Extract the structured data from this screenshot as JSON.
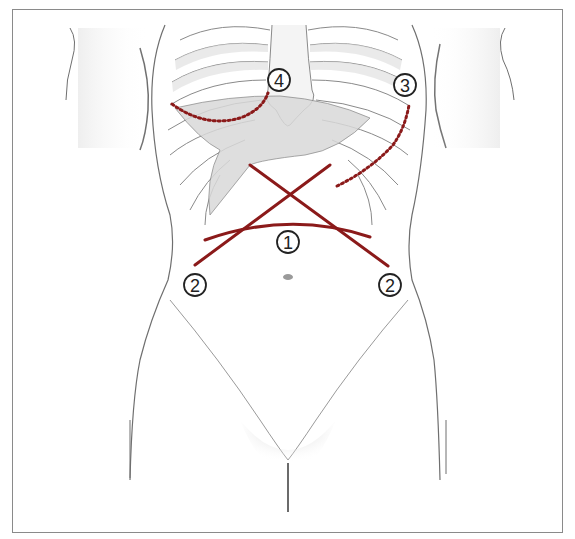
{
  "figure": {
    "type": "anatomical-illustration",
    "frame_color": "#8a8a8a",
    "incision_color": "#8b1a1a",
    "dotted_incision_color": "#8b1a1a",
    "outline_color": "#6f6f6f",
    "shade_color": "#d6d6d6"
  },
  "labels": [
    {
      "id": "1",
      "text": "1",
      "description": "transverse upper abdominal incision",
      "x": 288,
      "y": 242
    },
    {
      "id": "2a",
      "text": "2",
      "description": "cross incision, left lower end",
      "x": 195,
      "y": 285
    },
    {
      "id": "2b",
      "text": "2",
      "description": "cross incision, right lower end",
      "x": 390,
      "y": 285
    },
    {
      "id": "3",
      "text": "3",
      "description": "left subcostal incision (dotted)",
      "x": 405,
      "y": 85
    },
    {
      "id": "4",
      "text": "4",
      "description": "right subcostal incision (dotted)",
      "x": 279,
      "y": 80
    }
  ],
  "incisions": {
    "cross_line_a": {
      "x1": 250,
      "y1": 165,
      "x2": 195,
      "y2": 265
    },
    "cross_line_b": {
      "x1": 330,
      "y1": 165,
      "x2": 388,
      "y2": 266
    },
    "transverse_arc": {
      "x1": 205,
      "y1": 240,
      "cx": 290,
      "cy": 210,
      "x2": 370,
      "y2": 237
    },
    "dotted_right_subcostal": "M 172 104 Q 205 128 240 118 Q 262 110 268 93",
    "dotted_left_subcostal": "M 337 186 Q 370 170 393 145 Q 405 128 409 105"
  }
}
